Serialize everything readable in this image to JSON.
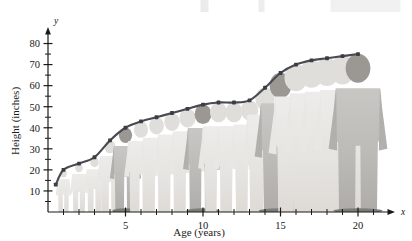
{
  "figure": {
    "kind": "textbook-growth-curve-figure",
    "background_color": "#ffffff",
    "curve_color": "#4a4a52",
    "marker_color": "#3c3c44",
    "axis_color": "#1a1a1a",
    "silhouette_color": "#e3e1dd",
    "highlight_figure_color": "#b9b7b4"
  },
  "axes": {
    "x_variable_label": "x",
    "y_variable_label": "y",
    "x_axis_title": "Age (years)",
    "y_axis_title": "Height (inches)",
    "x_tick_labels": [
      "5",
      "10",
      "15",
      "20"
    ],
    "y_tick_labels": [
      "10",
      "20",
      "30",
      "40",
      "50",
      "60",
      "70",
      "80"
    ]
  },
  "chart_data": {
    "type": "line",
    "title": "",
    "subtitle": "",
    "xlabel": "Age (years)",
    "ylabel": "Height (inches)",
    "xlim": [
      0,
      22
    ],
    "ylim": [
      0,
      85
    ],
    "x_major_ticks": [
      5,
      10,
      15,
      20
    ],
    "x_minor_ticks": [
      1,
      2,
      3,
      4,
      6,
      7,
      8,
      9,
      11,
      12,
      13,
      14,
      16,
      17,
      18,
      19,
      21
    ],
    "y_major_ticks": [
      10,
      20,
      30,
      40,
      50,
      60,
      70,
      80
    ],
    "y_minor_ticks": [
      5,
      15,
      25,
      35,
      45,
      55,
      65,
      75
    ],
    "grid": false,
    "legend": false,
    "legend_position": "none",
    "markers": true,
    "series": [
      {
        "name": "Height",
        "x": [
          0.5,
          1,
          2,
          3,
          4,
          5,
          6,
          7,
          8,
          9,
          10,
          11,
          12,
          13,
          14,
          15,
          16,
          17,
          18,
          19,
          20
        ],
        "values": [
          13,
          20,
          23,
          26,
          34,
          40,
          43,
          45,
          47,
          49,
          51,
          52,
          52,
          53,
          59,
          66,
          70,
          72,
          73,
          74,
          75
        ]
      }
    ],
    "annotations": [
      {
        "text": "x",
        "role": "x-axis-variable",
        "x": 21.8,
        "y": 0
      },
      {
        "text": "y",
        "role": "y-axis-variable",
        "x": 0,
        "y": 85
      }
    ]
  },
  "silhouettes": {
    "description": "stacked human figure silhouettes behind the curve, one per year",
    "ages": [
      1,
      2,
      3,
      4,
      5,
      6,
      7,
      8,
      9,
      10,
      11,
      12,
      13,
      14,
      15,
      16,
      17,
      18,
      19,
      20
    ],
    "emphasized_ages": [
      5,
      10,
      15,
      20
    ]
  }
}
